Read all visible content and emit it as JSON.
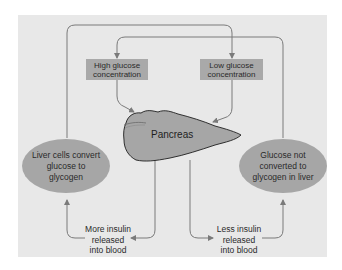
{
  "diagram": {
    "type": "feedback-loop",
    "colors": {
      "background": "#e8e8e8",
      "box_fill": "#a9a9a9",
      "oval_fill": "#a6a6a6",
      "pancreas_fill": "#a6a6a6",
      "line": "#7a7a7a"
    },
    "nodes": {
      "high_glucose": {
        "label": "High glucose\nconcentration"
      },
      "low_glucose": {
        "label": "Low glucose\nconcentration"
      },
      "pancreas": {
        "label": "Pancreas"
      },
      "liver_convert": {
        "label": "Liver cells convert\nglucose to\nglycogen"
      },
      "glucose_not_converted": {
        "label": "Glucose not\nconverted to\nglycogen in liver"
      },
      "more_insulin": {
        "label": "More insulin\nreleased\ninto blood"
      },
      "less_insulin": {
        "label": "Less insulin\nreleased\ninto blood"
      }
    },
    "edges": [
      {
        "from": "high_glucose",
        "to": "pancreas"
      },
      {
        "from": "low_glucose",
        "to": "pancreas"
      },
      {
        "from": "pancreas",
        "to": "more_insulin"
      },
      {
        "from": "pancreas",
        "to": "less_insulin"
      },
      {
        "from": "more_insulin",
        "to": "liver_convert"
      },
      {
        "from": "less_insulin",
        "to": "glucose_not_converted"
      },
      {
        "from": "liver_convert",
        "to": "low_glucose"
      },
      {
        "from": "glucose_not_converted",
        "to": "high_glucose"
      }
    ]
  }
}
